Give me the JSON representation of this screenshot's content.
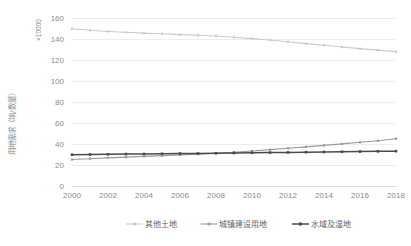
{
  "chart_data": {
    "type": "line",
    "title": "",
    "subtitle": "",
    "xlabel": "",
    "ylabel": "用地需求（垧/数量）",
    "unit_label": "×10000",
    "xlim": [
      2000,
      2018
    ],
    "ylim": [
      0,
      160
    ],
    "y_ticks": [
      0,
      20,
      40,
      60,
      80,
      100,
      120,
      140,
      160
    ],
    "x_ticks": [
      2000,
      2002,
      2004,
      2006,
      2008,
      2010,
      2012,
      2014,
      2016,
      2018
    ],
    "x": [
      2000,
      2001,
      2002,
      2003,
      2004,
      2005,
      2006,
      2007,
      2008,
      2009,
      2010,
      2011,
      2012,
      2013,
      2014,
      2015,
      2016,
      2017,
      2018
    ],
    "grid": "horizontal",
    "legend_position": "bottom",
    "marker": "square",
    "series": [
      {
        "name": "其他土地",
        "color": "#c9c9c9",
        "values": [
          149.8,
          148.3,
          147.2,
          146.4,
          145.6,
          145.0,
          144.2,
          143.6,
          142.9,
          141.6,
          140.4,
          139.0,
          137.4,
          135.6,
          134.0,
          132.4,
          130.8,
          129.4,
          128.0
        ]
      },
      {
        "name": "城镇建设用地",
        "color": "#9a9a9a",
        "values": [
          25.2,
          26.0,
          26.8,
          27.5,
          28.2,
          28.9,
          29.6,
          30.4,
          31.2,
          32.2,
          33.4,
          34.6,
          35.9,
          37.3,
          38.7,
          40.1,
          41.6,
          43.1,
          45.0
        ]
      },
      {
        "name": "水域及湿地",
        "color": "#4a4a4a",
        "values": [
          29.8,
          30.0,
          30.2,
          30.4,
          30.5,
          30.7,
          30.9,
          31.0,
          31.2,
          31.4,
          31.6,
          31.8,
          32.0,
          32.2,
          32.4,
          32.6,
          32.8,
          33.0,
          33.2
        ]
      }
    ]
  },
  "axis": {
    "y_unit": "×10000",
    "y_title": "用地需求（垧/数量）"
  },
  "legend": {
    "items": [
      {
        "label": "其他土地",
        "color": "#c9c9c9"
      },
      {
        "label": "城镇建设用地",
        "color": "#9a9a9a"
      },
      {
        "label": "水域及湿地",
        "color": "#4a4a4a"
      }
    ]
  },
  "colors": {
    "background": "#ffffff",
    "grid": "#e8e8e8",
    "tick_label": "#8a8a8a",
    "legend_label": "#606060"
  }
}
